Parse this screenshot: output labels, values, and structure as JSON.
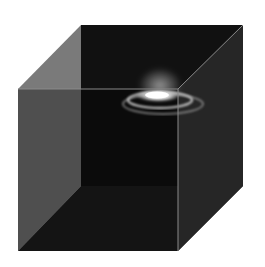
{
  "figure": {
    "colors": {
      "background": "#ffffff",
      "back_face": "#111111",
      "left_face": "#7a7a7a",
      "bottom_face": "#1e1e1e",
      "right_face": "#262626",
      "front_face": "#0a0a0a",
      "edge": "#8a8a8a",
      "galaxy_core": "#ffffff",
      "galaxy_arm": "#bdbdbd"
    },
    "cube": {
      "front": [
        [
          18,
          89
        ],
        [
          178,
          89
        ],
        [
          178,
          251
        ],
        [
          18,
          251
        ]
      ],
      "back": [
        [
          81,
          25
        ],
        [
          243,
          25
        ],
        [
          243,
          186
        ],
        [
          81,
          186
        ]
      ]
    },
    "galaxy": {
      "cx": 160,
      "cy": 97,
      "rx": 44,
      "ry": 12
    }
  }
}
